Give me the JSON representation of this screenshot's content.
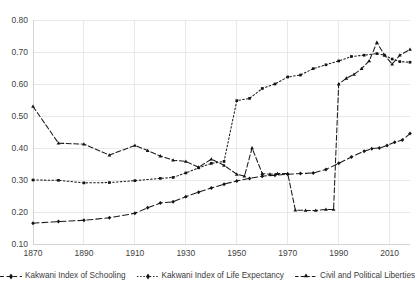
{
  "chart_data": {
    "type": "line",
    "title": "",
    "subtitle": "",
    "xlabel": "",
    "ylabel": "",
    "xlim": [
      1870,
      2018
    ],
    "ylim": [
      0.1,
      0.8
    ],
    "grid": true,
    "legend_position": "bottom",
    "x_ticks": [
      1870,
      1890,
      1910,
      1930,
      1950,
      1970,
      1990,
      2010
    ],
    "x_tick_labels": [
      "1870",
      "1890",
      "1910",
      "1930",
      "1950",
      "1970",
      "1990",
      "2010"
    ],
    "y_ticks": [
      0.1,
      0.2,
      0.3,
      0.4,
      0.5,
      0.6,
      0.7,
      0.8
    ],
    "y_tick_labels": [
      "0.10",
      "0.20",
      "0.30",
      "0.40",
      "0.50",
      "0.60",
      "0.70",
      "0.80"
    ],
    "series": [
      {
        "name": "Kakwani Index of Schooling",
        "marker": "diamond",
        "dash": "6,3",
        "color": "#1a1a1a",
        "points": [
          [
            1870,
            0.165
          ],
          [
            1880,
            0.17
          ],
          [
            1890,
            0.174
          ],
          [
            1900,
            0.182
          ],
          [
            1910,
            0.196
          ],
          [
            1915,
            0.213
          ],
          [
            1920,
            0.228
          ],
          [
            1925,
            0.232
          ],
          [
            1930,
            0.248
          ],
          [
            1935,
            0.262
          ],
          [
            1940,
            0.275
          ],
          [
            1945,
            0.287
          ],
          [
            1950,
            0.297
          ],
          [
            1955,
            0.305
          ],
          [
            1960,
            0.312
          ],
          [
            1965,
            0.315
          ],
          [
            1970,
            0.318
          ],
          [
            1975,
            0.32
          ],
          [
            1980,
            0.322
          ],
          [
            1985,
            0.333
          ],
          [
            1990,
            0.352
          ],
          [
            1995,
            0.372
          ],
          [
            2000,
            0.39
          ],
          [
            2003,
            0.398
          ],
          [
            2006,
            0.4
          ],
          [
            2009,
            0.408
          ],
          [
            2012,
            0.418
          ],
          [
            2015,
            0.425
          ],
          [
            2018,
            0.445
          ]
        ]
      },
      {
        "name": "Kakwani Index of Life Expectancy",
        "marker": "square",
        "dash": "1.6,2.2",
        "color": "#1a1a1a",
        "points": [
          [
            1870,
            0.3
          ],
          [
            1880,
            0.299
          ],
          [
            1890,
            0.291
          ],
          [
            1900,
            0.292
          ],
          [
            1910,
            0.298
          ],
          [
            1920,
            0.305
          ],
          [
            1925,
            0.308
          ],
          [
            1930,
            0.322
          ],
          [
            1935,
            0.338
          ],
          [
            1940,
            0.352
          ],
          [
            1945,
            0.358
          ],
          [
            1950,
            0.548
          ],
          [
            1955,
            0.555
          ],
          [
            1960,
            0.586
          ],
          [
            1965,
            0.6
          ],
          [
            1970,
            0.622
          ],
          [
            1975,
            0.628
          ],
          [
            1980,
            0.648
          ],
          [
            1985,
            0.66
          ],
          [
            1990,
            0.672
          ],
          [
            1995,
            0.686
          ],
          [
            2000,
            0.69
          ],
          [
            2005,
            0.695
          ],
          [
            2008,
            0.69
          ],
          [
            2011,
            0.678
          ],
          [
            2014,
            0.67
          ],
          [
            2018,
            0.668
          ]
        ]
      },
      {
        "name": "Civil and Political Liberties",
        "marker": "triangle",
        "dash": "5,2.5",
        "color": "#1a1a1a",
        "points": [
          [
            1870,
            0.53
          ],
          [
            1880,
            0.415
          ],
          [
            1890,
            0.412
          ],
          [
            1900,
            0.378
          ],
          [
            1910,
            0.408
          ],
          [
            1915,
            0.392
          ],
          [
            1920,
            0.375
          ],
          [
            1925,
            0.362
          ],
          [
            1930,
            0.358
          ],
          [
            1935,
            0.34
          ],
          [
            1940,
            0.365
          ],
          [
            1945,
            0.346
          ],
          [
            1950,
            0.318
          ],
          [
            1953,
            0.312
          ],
          [
            1956,
            0.4
          ],
          [
            1960,
            0.32
          ],
          [
            1963,
            0.318
          ],
          [
            1966,
            0.32
          ],
          [
            1970,
            0.32
          ],
          [
            1973,
            0.206
          ],
          [
            1977,
            0.205
          ],
          [
            1981,
            0.205
          ],
          [
            1985,
            0.208
          ],
          [
            1988,
            0.208
          ],
          [
            1990,
            0.6
          ],
          [
            1993,
            0.618
          ],
          [
            1996,
            0.63
          ],
          [
            1999,
            0.648
          ],
          [
            2002,
            0.672
          ],
          [
            2005,
            0.73
          ],
          [
            2008,
            0.69
          ],
          [
            2011,
            0.662
          ],
          [
            2014,
            0.69
          ],
          [
            2018,
            0.708
          ]
        ]
      }
    ]
  },
  "legend": {
    "items": [
      {
        "label": "Kakwani Index of Schooling",
        "icon": "dashed-line-marker"
      },
      {
        "label": "Kakwani Index of Life Expectancy",
        "icon": "dotted-line-marker"
      },
      {
        "label": "Civil and Political Liberties",
        "icon": "dashdot-line-marker"
      }
    ]
  }
}
